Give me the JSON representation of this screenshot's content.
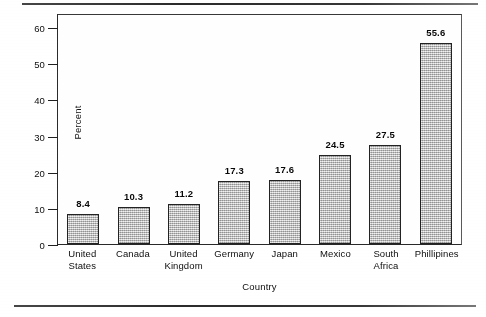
{
  "chart_data": {
    "type": "bar",
    "title": "",
    "xlabel": "Country",
    "ylabel": "Percent",
    "categories": [
      "United\nStates",
      "Canada",
      "United\nKingdom",
      "Germany",
      "Japan",
      "Mexico",
      "South\nAfrica",
      "Phillipines"
    ],
    "values": [
      8.4,
      10.3,
      11.2,
      17.3,
      17.6,
      24.5,
      27.5,
      55.6
    ],
    "value_labels": [
      "8.4",
      "10.3",
      "11.2",
      "17.3",
      "17.6",
      "24.5",
      "27.5",
      "55.6"
    ],
    "ylim": [
      0,
      60
    ],
    "yticks": [
      0,
      10,
      20,
      30,
      40,
      50,
      60
    ],
    "ytick_labels": [
      "0",
      "10",
      "20",
      "30",
      "40",
      "50",
      "60"
    ],
    "grid": false,
    "legend": null,
    "bar_fill_color": "#b9b9b9",
    "bar_border_color": "#262626",
    "frame_color": "#2e2e2e",
    "text_color": "#121212"
  },
  "page": {
    "rule_top": "",
    "rule_bottom": ""
  }
}
